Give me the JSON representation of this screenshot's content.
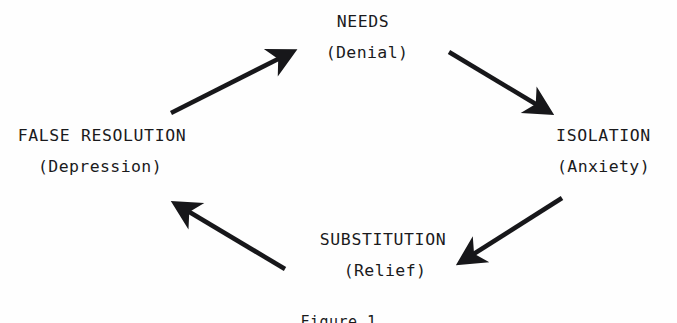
{
  "figure": {
    "type": "cycle-diagram",
    "caption": "Figure 1",
    "background_color": "#fefefe",
    "ink_color": "#1a1a1c",
    "direction": "clockwise",
    "node_count": 4,
    "arrow_count": 4
  },
  "nodes": [
    {
      "id": "needs",
      "primary": "NEEDS",
      "secondary": "(Denial)",
      "position": "top"
    },
    {
      "id": "isolation",
      "primary": "ISOLATION",
      "secondary": "(Anxiety)",
      "position": "right"
    },
    {
      "id": "substitution",
      "primary": "SUBSTITUTION",
      "secondary": "(Relief)",
      "position": "bottom"
    },
    {
      "id": "false-resolution",
      "primary": "FALSE RESOLUTION",
      "secondary": "(Depression)",
      "position": "left"
    }
  ],
  "arrows": [
    {
      "id": "needs-to-isolation",
      "from": "needs",
      "to": "isolation",
      "direction": "down-right",
      "x1": 449,
      "y1": 52,
      "x2": 552,
      "y2": 114
    },
    {
      "id": "isolation-to-substitution",
      "from": "isolation",
      "to": "substitution",
      "direction": "down-left",
      "x1": 562,
      "y1": 198,
      "x2": 457,
      "y2": 264
    },
    {
      "id": "substitution-to-false-resolution",
      "from": "substitution",
      "to": "false-resolution",
      "direction": "up-left",
      "x1": 285,
      "y1": 269,
      "x2": 172,
      "y2": 201
    },
    {
      "id": "false-resolution-to-needs",
      "from": "false-resolution",
      "to": "needs",
      "direction": "up-right",
      "x1": 171,
      "y1": 113,
      "x2": 296,
      "y2": 50
    }
  ]
}
